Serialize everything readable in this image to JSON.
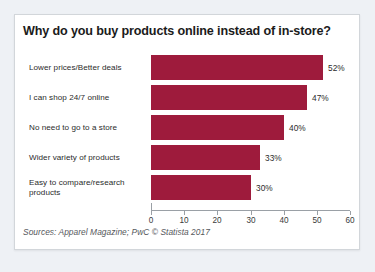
{
  "chart_data": {
    "type": "bar",
    "orientation": "horizontal",
    "title": "Why do you buy products online instead of in-store?",
    "categories": [
      "Lower prices/Better deals",
      "I can shop 24/7 online",
      "No need to go to a store",
      "Wider variety of products",
      "Easy to compare/research products"
    ],
    "values": [
      52,
      47,
      40,
      33,
      30
    ],
    "value_labels": [
      "52%",
      "47%",
      "40%",
      "33%",
      "30%"
    ],
    "xlabel": "",
    "ylabel": "",
    "xlim": [
      0,
      60
    ],
    "xticks": [
      0,
      10,
      20,
      30,
      40,
      50,
      60
    ],
    "xtick_labels": [
      "0",
      "10",
      "20",
      "30",
      "40",
      "50",
      "60"
    ],
    "grid": false,
    "legend": false,
    "bar_color": "#9E1B3C",
    "source": "Sources: Apparel Magazine; PwC © Statista 2017"
  },
  "card": {
    "background": "#ffffff",
    "border_color": "#d2d6da"
  },
  "page": {
    "background": "#eef1f5"
  }
}
